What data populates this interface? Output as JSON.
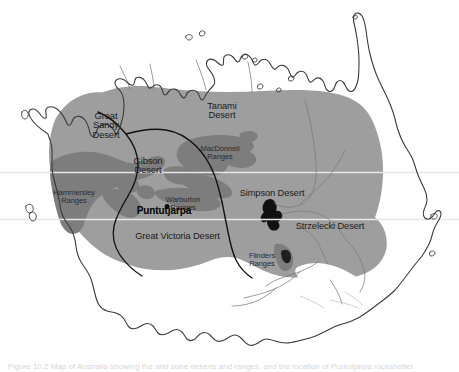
{
  "figure": {
    "caption": "Figure 10.2 Map of Australia showing the arid zone deserts and ranges, and the location of Puntutjarpa rockshelter."
  },
  "colors": {
    "background": "#ffffff",
    "arid_zone_fill": "#9e9e9e",
    "ranges_fill": "#7d7d7d",
    "lake_fill": "#111111",
    "coastline": "#3b3b3b",
    "river": "#6e6e6e",
    "desert_boundary": "#111111",
    "graticule": "#e2e2e2",
    "label_text": "#1b1b1b"
  },
  "deserts": [
    {
      "name": "great-sandy-desert",
      "label": "Great\nSandy\nDesert",
      "x": 106,
      "y": 122
    },
    {
      "name": "tanami-desert",
      "label": "Tanami\nDesert",
      "x": 222,
      "y": 112
    },
    {
      "name": "gibson-desert",
      "label": "Gibson\nDesert",
      "x": 148,
      "y": 167
    },
    {
      "name": "simpson-desert",
      "label": "Simpson Desert",
      "x": 272,
      "y": 195
    },
    {
      "name": "strzelecki-desert",
      "label": "Strzelecki Desert",
      "x": 330,
      "y": 228
    },
    {
      "name": "great-victoria-desert",
      "label": "Great Victoria Desert",
      "x": 177,
      "y": 238
    }
  ],
  "ranges": [
    {
      "name": "macdonnell-ranges",
      "label": "MacDonnell\nRanges",
      "x": 219,
      "y": 152
    },
    {
      "name": "hammersley-ranges",
      "label": "Hammersley\nRanges",
      "x": 73,
      "y": 196
    },
    {
      "name": "warburton-ranges",
      "label": "Warburton\nRanges",
      "x": 182,
      "y": 193
    },
    {
      "name": "flinders-ranges",
      "label": "Flinders\nRanges",
      "x": 262,
      "y": 258
    }
  ],
  "sites": [
    {
      "name": "puntutjarpa",
      "label": "Puntutjarpa",
      "x": 163,
      "y": 211,
      "dot_x": 166,
      "dot_y": 205
    }
  ]
}
